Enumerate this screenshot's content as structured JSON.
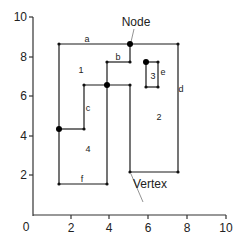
{
  "figure": {
    "type": "planar-graph-diagram",
    "x_axis": {
      "ticks": [
        "2",
        "4",
        "6",
        "8",
        "10"
      ],
      "origin_label": "0",
      "range": [
        0,
        10
      ]
    },
    "y_axis": {
      "ticks": [
        "2",
        "4",
        "6",
        "8",
        "10"
      ],
      "range": [
        0,
        10
      ]
    },
    "annotations": {
      "node": "Node",
      "vertex": "Vertex"
    },
    "edge_labels": {
      "a": "a",
      "b": "b",
      "c": "c",
      "d": "d",
      "e": "e",
      "f": "f"
    },
    "face_labels": {
      "f1": "1",
      "f2": "2",
      "f3": "3",
      "f4": "4"
    },
    "colors": {
      "line": "#1a1a1a",
      "axis": "#333333",
      "leader": "#777777"
    }
  }
}
